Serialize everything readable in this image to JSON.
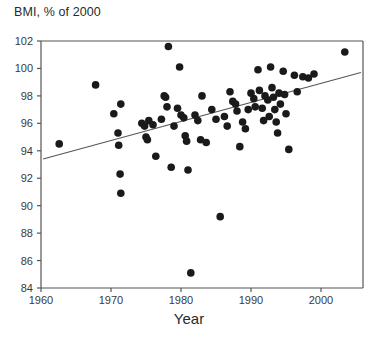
{
  "chart_data": {
    "type": "scatter",
    "title": "BMI, % of 2000",
    "xlabel": "Year",
    "ylabel": "",
    "xlim": [
      1960,
      2006
    ],
    "ylim": [
      84,
      102
    ],
    "xticks": [
      1960,
      1970,
      1980,
      1990,
      2000
    ],
    "xtick_labels": [
      "1960",
      "1970",
      "1980",
      "1990",
      "2000"
    ],
    "yticks": [
      84,
      86,
      88,
      90,
      92,
      94,
      96,
      98,
      100,
      102
    ],
    "ytick_labels": [
      "84",
      "86",
      "88",
      "90",
      "92",
      "94",
      "96",
      "98",
      "100",
      "102"
    ],
    "grid": false,
    "legend": null,
    "marker_color": "#1a1a1a",
    "marker_size": 7.6,
    "axis_color": "#555555",
    "trendline": {
      "type": "line",
      "color": "#555555",
      "x": [
        1960.3,
        2005.7
      ],
      "y": [
        93.4,
        99.7
      ]
    },
    "points": [
      {
        "x": 1962.6,
        "y": 94.5
      },
      {
        "x": 1967.8,
        "y": 98.8
      },
      {
        "x": 1970.4,
        "y": 96.7
      },
      {
        "x": 1971.4,
        "y": 97.4
      },
      {
        "x": 1971.0,
        "y": 95.3
      },
      {
        "x": 1971.1,
        "y": 94.4
      },
      {
        "x": 1971.3,
        "y": 92.3
      },
      {
        "x": 1971.4,
        "y": 90.9
      },
      {
        "x": 1974.4,
        "y": 96.0
      },
      {
        "x": 1974.8,
        "y": 95.8
      },
      {
        "x": 1975.0,
        "y": 95.0
      },
      {
        "x": 1975.2,
        "y": 94.8
      },
      {
        "x": 1975.4,
        "y": 96.2
      },
      {
        "x": 1976.0,
        "y": 95.9
      },
      {
        "x": 1976.4,
        "y": 93.6
      },
      {
        "x": 1977.2,
        "y": 96.3
      },
      {
        "x": 1977.6,
        "y": 98.0
      },
      {
        "x": 1977.8,
        "y": 97.9
      },
      {
        "x": 1978.0,
        "y": 97.2
      },
      {
        "x": 1978.2,
        "y": 101.6
      },
      {
        "x": 1978.6,
        "y": 92.8
      },
      {
        "x": 1979.0,
        "y": 95.8
      },
      {
        "x": 1979.5,
        "y": 97.1
      },
      {
        "x": 1979.8,
        "y": 100.1
      },
      {
        "x": 1980.0,
        "y": 96.6
      },
      {
        "x": 1980.4,
        "y": 96.4
      },
      {
        "x": 1980.6,
        "y": 95.1
      },
      {
        "x": 1980.8,
        "y": 94.7
      },
      {
        "x": 1981.0,
        "y": 92.6
      },
      {
        "x": 1981.4,
        "y": 85.1
      },
      {
        "x": 1982.0,
        "y": 96.6
      },
      {
        "x": 1982.4,
        "y": 96.2
      },
      {
        "x": 1982.8,
        "y": 94.8
      },
      {
        "x": 1983.0,
        "y": 98.0
      },
      {
        "x": 1983.6,
        "y": 94.6
      },
      {
        "x": 1984.4,
        "y": 97.0
      },
      {
        "x": 1985.0,
        "y": 96.3
      },
      {
        "x": 1985.6,
        "y": 89.2
      },
      {
        "x": 1986.2,
        "y": 96.5
      },
      {
        "x": 1986.6,
        "y": 95.8
      },
      {
        "x": 1987.0,
        "y": 98.3
      },
      {
        "x": 1987.4,
        "y": 97.6
      },
      {
        "x": 1987.8,
        "y": 97.4
      },
      {
        "x": 1988.0,
        "y": 96.9
      },
      {
        "x": 1988.4,
        "y": 94.3
      },
      {
        "x": 1988.8,
        "y": 96.1
      },
      {
        "x": 1989.2,
        "y": 95.6
      },
      {
        "x": 1989.6,
        "y": 97.0
      },
      {
        "x": 1990.0,
        "y": 98.2
      },
      {
        "x": 1990.4,
        "y": 97.8
      },
      {
        "x": 1990.6,
        "y": 97.2
      },
      {
        "x": 1991.0,
        "y": 99.9
      },
      {
        "x": 1991.2,
        "y": 98.4
      },
      {
        "x": 1991.6,
        "y": 97.1
      },
      {
        "x": 1991.8,
        "y": 96.2
      },
      {
        "x": 1992.0,
        "y": 98.0
      },
      {
        "x": 1992.4,
        "y": 97.7
      },
      {
        "x": 1992.6,
        "y": 96.5
      },
      {
        "x": 1992.8,
        "y": 100.1
      },
      {
        "x": 1993.0,
        "y": 98.6
      },
      {
        "x": 1993.2,
        "y": 97.9
      },
      {
        "x": 1993.4,
        "y": 97.0
      },
      {
        "x": 1993.6,
        "y": 96.1
      },
      {
        "x": 1993.8,
        "y": 95.3
      },
      {
        "x": 1994.0,
        "y": 98.2
      },
      {
        "x": 1994.2,
        "y": 97.4
      },
      {
        "x": 1994.6,
        "y": 99.8
      },
      {
        "x": 1994.8,
        "y": 98.1
      },
      {
        "x": 1995.0,
        "y": 96.7
      },
      {
        "x": 1995.4,
        "y": 94.1
      },
      {
        "x": 1996.2,
        "y": 99.5
      },
      {
        "x": 1996.6,
        "y": 98.3
      },
      {
        "x": 1997.4,
        "y": 99.4
      },
      {
        "x": 1998.2,
        "y": 99.3
      },
      {
        "x": 1999.0,
        "y": 99.6
      },
      {
        "x": 2003.4,
        "y": 101.2
      }
    ]
  }
}
